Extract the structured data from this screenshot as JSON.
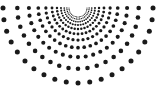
{
  "figure": {
    "type": "radial-dot-burst",
    "background_color": "#ffffff",
    "dot_color": "#1a1a1a",
    "width": 157,
    "height": 90
  },
  "chart_data": {
    "type": "scatter",
    "subtitle": "",
    "xlabel": "",
    "ylabel": "",
    "grid": false,
    "legend_position": "none",
    "xlim": [
      0,
      157
    ],
    "ylim": [
      0,
      90
    ],
    "layout": {
      "center_x": 78,
      "center_y": 8,
      "ray_count": 21,
      "arc_count": 11,
      "angle_start_deg": 0,
      "angle_end_deg": 180,
      "radius_min": 9,
      "radius_max": 75,
      "radius_growth": 1.28,
      "dot_radius_min": 0.55,
      "dot_radius_max": 2.5,
      "dot_color": "#1a1a1a"
    },
    "annotations": [],
    "series": [
      {
        "name": "radial-dots",
        "marker": "circle",
        "color": "#1a1a1a",
        "description": "Dots arranged on 21 rays spanning a 180 degree fan below a top-center apex, across 11 concentric arcs of geometrically increasing radius; marker size increases with radius."
      }
    ]
  }
}
